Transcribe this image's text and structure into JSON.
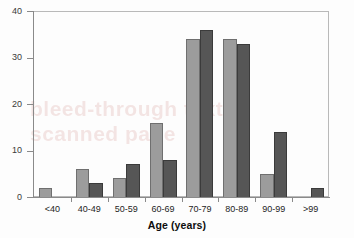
{
  "chart_data": {
    "type": "bar",
    "title": "",
    "subtitle": "",
    "xlabel": "Age (years)",
    "ylabel": "",
    "categories": [
      "<40",
      "40-49",
      "50-59",
      "60-69",
      "70-79",
      "80-89",
      "90-99",
      ">99"
    ],
    "series": [
      {
        "name": "series-1",
        "color": "#9c9c9c",
        "values": [
          2,
          6,
          4,
          16,
          34,
          34,
          5,
          0
        ]
      },
      {
        "name": "series-2",
        "color": "#565656",
        "values": [
          0,
          3,
          7,
          8,
          36,
          33,
          14,
          2
        ]
      }
    ],
    "ylim": [
      0,
      40
    ],
    "yticks": [
      0,
      10,
      20,
      30,
      40
    ],
    "ytick_labels": [
      "0",
      "10",
      "20",
      "30",
      "40"
    ],
    "grid": false,
    "legend": "none",
    "annotations": []
  },
  "watermark": {
    "line1": "bleed-through text",
    "line2": "scanned page"
  }
}
